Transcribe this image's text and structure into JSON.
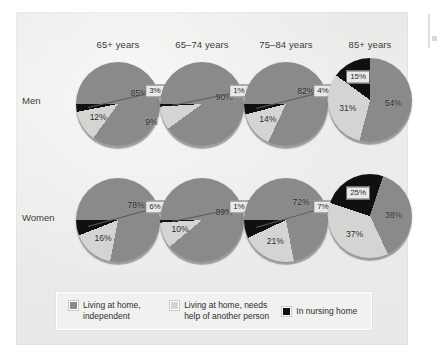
{
  "figure": {
    "row_labels": [
      "Men",
      "Women"
    ],
    "column_headers": [
      "65+ years",
      "65–74 years",
      "75–84 years",
      "85+ years"
    ],
    "legend": [
      {
        "label_line1": "Living at home,",
        "label_line2": "independent",
        "color": "#8a8a8a",
        "swatch_name": "legend-swatch-independent"
      },
      {
        "label_line1": "Living at home, needs",
        "label_line2": "help of another person",
        "color": "#d4d4d2",
        "swatch_name": "legend-swatch-needs-help"
      },
      {
        "label_line1": "In nursing home",
        "label_line2": "",
        "color": "#101010",
        "swatch_name": "legend-swatch-nursing-home"
      }
    ]
  },
  "chart_data": {
    "type": "pie",
    "title": "",
    "categories": [
      "Living at home, independent",
      "Living at home, needs help of another person",
      "In nursing home"
    ],
    "colors": [
      "#8a8a8a",
      "#d4d4d2",
      "#101010"
    ],
    "rows": [
      "Men",
      "Women"
    ],
    "columns": [
      "65+ years",
      "65–74 years",
      "75–84 years",
      "85+ years"
    ],
    "unit": "%",
    "pies": [
      {
        "row": "Men",
        "column": "65+ years",
        "values": [
          85,
          12,
          3
        ],
        "labels": [
          "85%",
          "12%",
          "3%"
        ],
        "callout_index": 2
      },
      {
        "row": "Men",
        "column": "65–74 years",
        "values": [
          90,
          9,
          1
        ],
        "labels": [
          "90%",
          "9%",
          "1%"
        ],
        "callout_index": 2
      },
      {
        "row": "Men",
        "column": "75–84 years",
        "values": [
          82,
          14,
          4
        ],
        "labels": [
          "82%",
          "14%",
          "4%"
        ],
        "callout_index": 2
      },
      {
        "row": "Men",
        "column": "85+ years",
        "values": [
          54,
          31,
          15
        ],
        "labels": [
          "54%",
          "31%",
          "15%"
        ],
        "callout_index": 2
      },
      {
        "row": "Women",
        "column": "65+ years",
        "values": [
          78,
          16,
          6
        ],
        "labels": [
          "78%",
          "16%",
          "6%"
        ],
        "callout_index": 2
      },
      {
        "row": "Women",
        "column": "65–74 years",
        "values": [
          89,
          10,
          1
        ],
        "labels": [
          "89%",
          "10%",
          "1%"
        ],
        "callout_index": 2
      },
      {
        "row": "Women",
        "column": "75–84 years",
        "values": [
          72,
          21,
          7
        ],
        "labels": [
          "72%",
          "21%",
          "7%"
        ],
        "callout_index": 2
      },
      {
        "row": "Women",
        "column": "85+ years",
        "values": [
          38,
          37,
          25
        ],
        "labels": [
          "38%",
          "37%",
          "25%"
        ],
        "callout_index": 2
      }
    ]
  },
  "layout": {
    "pie_positions": [
      {
        "left": 76,
        "top": 62
      },
      {
        "left": 160,
        "top": 62
      },
      {
        "left": 244,
        "top": 62
      },
      {
        "left": 328,
        "top": 58
      },
      {
        "left": 76,
        "top": 178
      },
      {
        "left": 160,
        "top": 178
      },
      {
        "left": 244,
        "top": 178
      },
      {
        "left": 328,
        "top": 174
      }
    ],
    "header_lefts": [
      75,
      159,
      243,
      327
    ],
    "row_label_tops": [
      95,
      212
    ],
    "start_angles": [
      -90,
      -90,
      -90,
      0,
      -90,
      -90,
      -90,
      18
    ]
  }
}
